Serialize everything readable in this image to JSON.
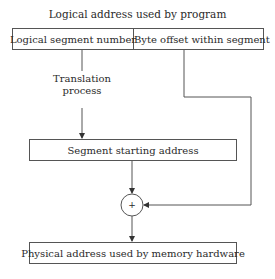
{
  "diagram": {
    "top_caption": "Logical address used by program",
    "logical_address": {
      "segment_field": "Logical segment number",
      "offset_field": "Byte offset within segment"
    },
    "translation_label_line1": "Translation",
    "translation_label_line2": "process",
    "segment_start_box": "Segment starting address",
    "adder_symbol": "+",
    "physical_address_box": "Physical address used by memory hardware"
  }
}
